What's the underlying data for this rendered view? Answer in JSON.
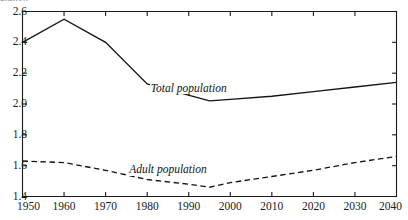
{
  "figure": {
    "cropped_title": "ulation",
    "background_color": "#ffffff",
    "ink_color": "#1a1a1a"
  },
  "chart_data": {
    "type": "line",
    "title": "",
    "xlabel": "",
    "ylabel": "",
    "xlim": [
      1950,
      2040
    ],
    "ylim": [
      1.4,
      2.6
    ],
    "grid": false,
    "legend_position": "inline-annotation",
    "x_ticks": [
      1950,
      1960,
      1970,
      1980,
      1990,
      2000,
      2010,
      2020,
      2030,
      2040
    ],
    "x_tick_labels": [
      "1950",
      "1960",
      "1970",
      "1980",
      "1990",
      "2000",
      "2010",
      "2020",
      "2030",
      "2040"
    ],
    "y_ticks": [
      1.4,
      1.6,
      1.8,
      2.0,
      2.2,
      2.4,
      2.6
    ],
    "y_tick_labels": [
      "1.4",
      "1.6",
      "1.8",
      "2.0",
      "2.2",
      "2.4",
      "2.6"
    ],
    "series": [
      {
        "name": "Total population",
        "style": "solid",
        "color": "#141414",
        "label_x": 1990,
        "label_y": 2.1,
        "x": [
          1950,
          1960,
          1970,
          1980,
          1995,
          2000,
          2010,
          2020,
          2030,
          2040
        ],
        "values": [
          2.4,
          2.55,
          2.4,
          2.13,
          2.02,
          2.03,
          2.05,
          2.08,
          2.11,
          2.14
        ]
      },
      {
        "name": "Adult population",
        "style": "dashed",
        "color": "#141414",
        "label_x": 1985,
        "label_y": 1.57,
        "x": [
          1950,
          1960,
          1970,
          1980,
          1990,
          1995,
          2000,
          2010,
          2020,
          2030,
          2040
        ],
        "values": [
          1.63,
          1.62,
          1.57,
          1.51,
          1.48,
          1.46,
          1.49,
          1.53,
          1.57,
          1.62,
          1.66
        ]
      }
    ]
  }
}
